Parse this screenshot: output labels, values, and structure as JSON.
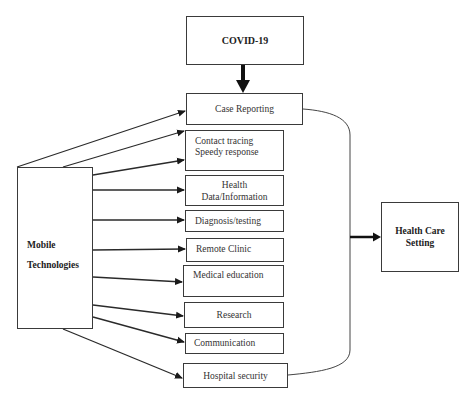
{
  "diagram": {
    "source": {
      "label": "COVID-19"
    },
    "hub": {
      "label_line1": "Mobile",
      "label_line2": "Technologies"
    },
    "target": {
      "label_line1": "Health Care",
      "label_line2": "Setting"
    },
    "applications": [
      {
        "line1": "Case Reporting",
        "line2": ""
      },
      {
        "line1": "Contact tracing",
        "line2": "Speedy response"
      },
      {
        "line1": "Health",
        "line2": "Data/Information"
      },
      {
        "line1": "Diagnosis/testing",
        "line2": ""
      },
      {
        "line1": "Remote Clinic",
        "line2": ""
      },
      {
        "line1": "Medical education",
        "line2": ""
      },
      {
        "line1": "Research",
        "line2": ""
      },
      {
        "line1": "Communication",
        "line2": ""
      },
      {
        "line1": "Hospital security",
        "line2": ""
      }
    ],
    "colors": {
      "line": "#2a2a2a",
      "box_border": "#3a3a3a",
      "background": "#ffffff"
    }
  }
}
